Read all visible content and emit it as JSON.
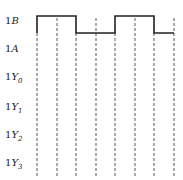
{
  "diagram": {
    "type": "timing-diagram",
    "signals": [
      {
        "id": "1B",
        "prefix": "1",
        "name": "B",
        "sub": "",
        "y": 22,
        "waveform": "0,1,1,0,0,1,1,0"
      },
      {
        "id": "1A",
        "prefix": "1",
        "name": "A",
        "sub": "",
        "y": 50,
        "waveform": ""
      },
      {
        "id": "1Y0",
        "prefix": "1",
        "name": "Y",
        "sub": "0",
        "y": 78,
        "waveform": ""
      },
      {
        "id": "1Y1",
        "prefix": "1",
        "name": "Y",
        "sub": "1",
        "y": 108,
        "waveform": ""
      },
      {
        "id": "1Y2",
        "prefix": "1",
        "name": "Y",
        "sub": "2",
        "y": 136,
        "waveform": ""
      },
      {
        "id": "1Y3",
        "prefix": "1",
        "name": "Y",
        "sub": "3",
        "y": 164,
        "waveform": ""
      }
    ],
    "time_markers_x": [
      37,
      57,
      76,
      96,
      115,
      135,
      154,
      174
    ],
    "waveform_1B": {
      "high_y": 16,
      "low_y": 33,
      "transitions": [
        {
          "x": 37,
          "to": "high"
        },
        {
          "x": 76,
          "to": "low"
        },
        {
          "x": 115,
          "to": "high"
        },
        {
          "x": 154,
          "to": "low"
        }
      ]
    },
    "colors": {
      "line": "#222222",
      "dash": "#555555"
    }
  }
}
